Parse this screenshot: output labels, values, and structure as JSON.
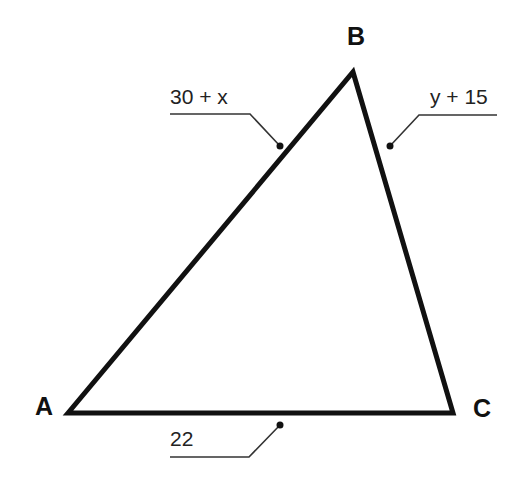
{
  "diagram": {
    "type": "triangle",
    "colors": {
      "stroke": "#111111",
      "leader": "#333333",
      "text": "#222222",
      "background": "#ffffff"
    },
    "vertices": [
      {
        "id": "A",
        "label": "A",
        "x": 68,
        "y": 413
      },
      {
        "id": "B",
        "label": "B",
        "x": 353,
        "y": 72
      },
      {
        "id": "C",
        "label": "C",
        "x": 453,
        "y": 413
      }
    ],
    "sides": [
      {
        "id": "AB",
        "label": "30 + x"
      },
      {
        "id": "BC",
        "label": "y + 15"
      },
      {
        "id": "AC",
        "label": "22"
      }
    ]
  }
}
